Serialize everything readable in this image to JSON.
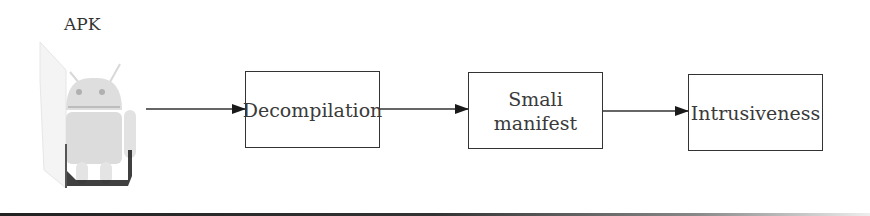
{
  "diagram": {
    "source_label": "APK",
    "source_icon": "android-robot-icon",
    "steps": [
      {
        "label": "Decompilation"
      },
      {
        "label": "Smali\nmanifest",
        "line1": "Smali",
        "line2": "manifest"
      },
      {
        "label": "Intrusiveness"
      }
    ],
    "edges": [
      {
        "from": "APK",
        "to": "Decompilation"
      },
      {
        "from": "Decompilation",
        "to": "Smali manifest"
      },
      {
        "from": "Smali manifest",
        "to": "Intrusiveness"
      }
    ],
    "colors": {
      "stroke": "#333333",
      "text": "#3a3a3a",
      "android_body": "#dcdcdc"
    }
  }
}
